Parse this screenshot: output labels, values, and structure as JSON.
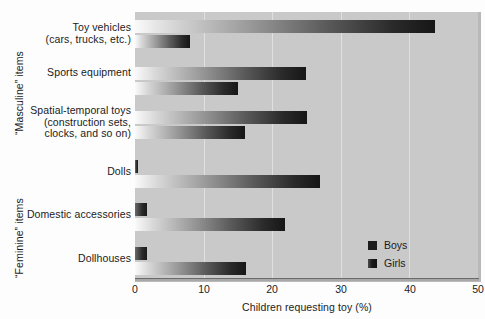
{
  "chart_data": {
    "type": "bar",
    "orientation": "horizontal",
    "title": "",
    "xlabel": "Children requesting toy (%)",
    "ylabel": "",
    "xlim": [
      0,
      50
    ],
    "xticks": [
      0,
      10,
      20,
      30,
      40,
      50
    ],
    "grid": "vertical",
    "legend_position": "bottom-right",
    "categories": [
      "Toy vehicles (cars, trucks, etc.)",
      "Sports equipment",
      "Spatial-temporal toys (construction sets, clocks, and so on)",
      "Dolls",
      "Domestic accessories",
      "Dollhouses"
    ],
    "series": [
      {
        "name": "Boys",
        "values": [
          43.7,
          24.9,
          25.1,
          0.5,
          1.7,
          1.7
        ]
      },
      {
        "name": "Girls",
        "values": [
          8.0,
          15.0,
          16.0,
          27.0,
          21.9,
          16.2
        ]
      }
    ]
  },
  "axis": {
    "x_title": "Children requesting toy (%)",
    "ticks": [
      {
        "label": "0",
        "value": 0
      },
      {
        "label": "10",
        "value": 10
      },
      {
        "label": "20",
        "value": 20
      },
      {
        "label": "30",
        "value": 30
      },
      {
        "label": "40",
        "value": 40
      },
      {
        "label": "50",
        "value": 50
      }
    ]
  },
  "groups": [
    {
      "name": "masculine",
      "label": "“Masculine” items"
    },
    {
      "name": "feminine",
      "label": "“Feminine” items"
    }
  ],
  "categories": [
    {
      "line1": "Toy vehicles",
      "line2": "(cars, trucks, etc.)",
      "line3": ""
    },
    {
      "line1": "Sports equipment",
      "line2": "",
      "line3": ""
    },
    {
      "line1": "Spatial-temporal toys",
      "line2": "(construction sets,",
      "line3": "clocks, and so on)"
    },
    {
      "line1": "Dolls",
      "line2": "",
      "line3": ""
    },
    {
      "line1": "Domestic accessories",
      "line2": "",
      "line3": ""
    },
    {
      "line1": "Dollhouses",
      "line2": "",
      "line3": ""
    }
  ],
  "legend": {
    "items": [
      {
        "label": "Boys",
        "color": "#1d1d1d"
      },
      {
        "label": "Girls",
        "color": "#1a1a1a"
      }
    ]
  },
  "colors": {
    "plot_background": "#c9c9c9",
    "page_background": "#fdfdfd",
    "gridline": "#e0e0e0",
    "bar_dark": "#161616",
    "bar_light": "#fafafa",
    "text": "#1b1b1b"
  }
}
